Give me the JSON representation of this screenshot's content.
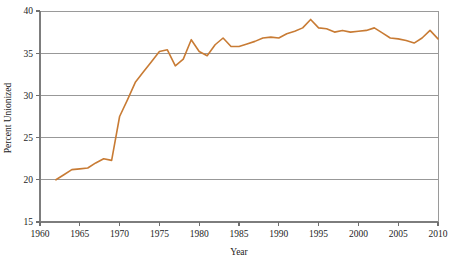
{
  "chart_data": {
    "type": "line",
    "title": "",
    "subtitle": "",
    "xlabel": "Year",
    "ylabel": "Percent Unionized",
    "xlim": [
      1960,
      2010
    ],
    "ylim": [
      15,
      40
    ],
    "xticks": [
      1960,
      1965,
      1970,
      1975,
      1980,
      1985,
      1990,
      1995,
      2000,
      2005,
      2010
    ],
    "yticks": [
      15,
      20,
      25,
      30,
      35,
      40
    ],
    "grid": "horizontal",
    "legend": "none",
    "annotations": [],
    "series": [
      {
        "name": "Percent Unionized",
        "color": "#C87B34",
        "x": [
          1962,
          1963,
          1964,
          1965,
          1966,
          1967,
          1968,
          1969,
          1970,
          1971,
          1972,
          1973,
          1974,
          1975,
          1976,
          1977,
          1978,
          1979,
          1980,
          1981,
          1982,
          1983,
          1984,
          1985,
          1986,
          1987,
          1988,
          1989,
          1990,
          1991,
          1992,
          1993,
          1994,
          1995,
          1996,
          1997,
          1998,
          1999,
          2000,
          2001,
          2002,
          2003,
          2004,
          2005,
          2006,
          2007,
          2008,
          2009,
          2010
        ],
        "values": [
          20.0,
          20.6,
          21.2,
          21.3,
          21.4,
          22.0,
          22.5,
          22.3,
          27.5,
          29.5,
          31.6,
          32.8,
          34.0,
          35.2,
          35.4,
          33.5,
          34.3,
          36.6,
          35.2,
          34.7,
          36.0,
          36.8,
          35.8,
          35.8,
          36.1,
          36.4,
          36.8,
          36.9,
          36.8,
          37.3,
          37.6,
          38.0,
          39.0,
          38.0,
          37.9,
          37.5,
          37.7,
          37.5,
          37.6,
          37.7,
          38.0,
          37.4,
          36.8,
          36.7,
          36.5,
          36.2,
          36.8,
          37.7,
          36.7
        ]
      }
    ]
  },
  "axis": {
    "y_tick_labels": [
      "15",
      "20",
      "25",
      "30",
      "35",
      "40"
    ],
    "x_tick_labels": [
      "1960",
      "1965",
      "1970",
      "1975",
      "1980",
      "1985",
      "1990",
      "1995",
      "2000",
      "2005",
      "2010"
    ],
    "y_title": "Percent Unionized",
    "x_title": "Year"
  },
  "style": {
    "line_color": "#C87B34",
    "grid_color": "#8d8d8d",
    "axis_color": "#7d7d7d",
    "background": "#ffffff"
  }
}
